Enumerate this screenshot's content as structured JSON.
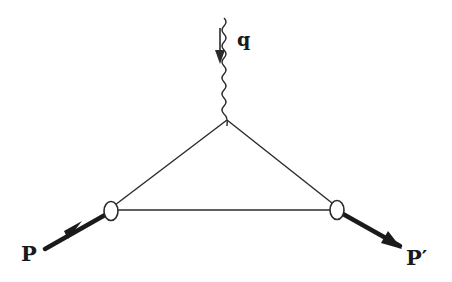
{
  "diagram": {
    "type": "feynman-triangle-vertex",
    "labels": {
      "photon": "q",
      "incoming": "P",
      "outgoing": "P′"
    },
    "colors": {
      "line": "#2a2a2a",
      "background": "#ffffff"
    },
    "nodes": [
      {
        "id": "top-vertex",
        "x": 227,
        "y": 120
      },
      {
        "id": "left-blob",
        "x": 111,
        "y": 211
      },
      {
        "id": "right-blob",
        "x": 337,
        "y": 210
      }
    ],
    "edges": [
      {
        "from": "top-vertex",
        "to": "left-blob",
        "style": "thin"
      },
      {
        "from": "top-vertex",
        "to": "right-blob",
        "style": "thin"
      },
      {
        "from": "left-blob",
        "to": "right-blob",
        "style": "thin"
      },
      {
        "from": "photon-source",
        "to": "top-vertex",
        "style": "wavy"
      },
      {
        "from": "P-in",
        "to": "left-blob",
        "style": "thick-arrow"
      },
      {
        "from": "right-blob",
        "to": "P-out",
        "style": "thick-arrow"
      }
    ]
  }
}
